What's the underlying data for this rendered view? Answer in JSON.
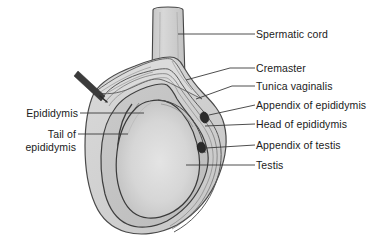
{
  "figure": {
    "kind": "anatomical-illustration",
    "background_color": "#ffffff",
    "text_color": "#1b1b1b",
    "line_color": "#3a3a3a"
  },
  "labels": {
    "spermatic_cord": "Spermatic cord",
    "cremaster": "Cremaster",
    "tunica_vaginalis": "Tunica vaginalis",
    "appendix_of_epididymis": "Appendix of epididymis",
    "head_of_epididymis": "Head of epididymis",
    "appendix_of_testis": "Appendix of testis",
    "testis": "Testis",
    "epididymis": "Epididymis",
    "tail_of_epididymis_line1": "Tail of",
    "tail_of_epididymis_line2": "epididymis"
  },
  "structures": {
    "spermatic_cord_fill": "#cfcfcf",
    "outer_wall_fill": "#d6d6d6",
    "tunica_layer_fill": "#c9c9c9",
    "cavity_fill": "#c4c4c4",
    "testis_fill": "#d2d2d2",
    "appendix_marker_fill": "#2b2b2b",
    "probe_fill": "#3b3b3b"
  }
}
